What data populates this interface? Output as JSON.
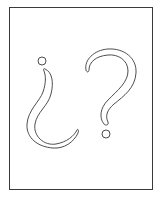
{
  "illustration": {
    "description": "Outline drawing of an inverted question mark and a question mark inside a rectangular frame",
    "glyphs": [
      {
        "name": "inverted-question-mark",
        "char": "¿"
      },
      {
        "name": "question-mark",
        "char": "?"
      }
    ],
    "colors": {
      "stroke": "#3a3a3a",
      "fill": "#ffffff",
      "background": "#ffffff"
    }
  }
}
